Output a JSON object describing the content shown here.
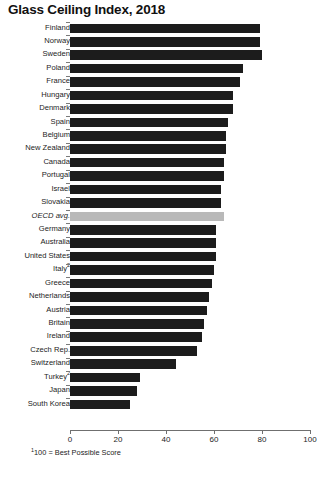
{
  "chart_data": {
    "type": "bar",
    "orientation": "horizontal",
    "title": "Glass Ceiling Index, 2018",
    "xlabel": "",
    "ylabel": "",
    "xlim": [
      0,
      100
    ],
    "xticks": [
      "0",
      "20",
      "40",
      "60",
      "80",
      "100"
    ],
    "grid": false,
    "legend": "none",
    "footnote": "100 = Best Possible Score",
    "footnote_marker": "1",
    "source": "",
    "highlight_category": "OECD avg.",
    "bar_color": "#1c1c1c",
    "highlight_color": "#b9b9b9",
    "categories": [
      "Finland",
      "Norway",
      "Sweden",
      "Poland",
      "France",
      "Hungary",
      "Denmark",
      "Spain",
      "Belgium",
      "New Zealand",
      "Canada",
      "Portugal",
      "Israel",
      "Slovakia",
      "OECD avg.",
      "Germany",
      "Australia",
      "United States",
      "Italy",
      "Greece",
      "Netherlands",
      "Austria",
      "Britain",
      "Ireland",
      "Czech Rep.",
      "Switzerland",
      "Turkey",
      "Japan",
      "South Korea"
    ],
    "values": [
      79,
      79,
      80,
      72,
      71,
      68,
      68,
      66,
      65,
      65,
      64,
      64,
      63,
      63,
      64,
      61,
      61,
      61,
      60,
      59,
      58,
      57,
      56,
      55,
      53,
      44,
      29,
      28,
      25
    ],
    "category_markers": {
      "Italy": "2",
      "Turkey": "2"
    }
  }
}
